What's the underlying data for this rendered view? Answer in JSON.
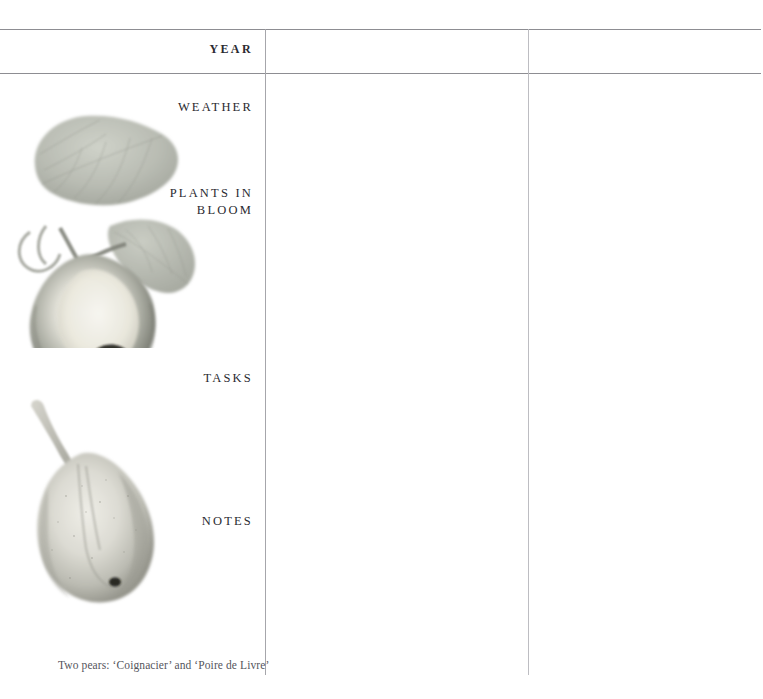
{
  "page": {
    "background_color": "#ffffff",
    "rule_color": "#8d8d92",
    "vertical_rule_color": "#a6a6ab",
    "text_color": "#2a2a30"
  },
  "columns": {
    "label_column_right_edge": 253,
    "divider_1_x": 265,
    "divider_2_x": 528
  },
  "header": {
    "year_label": "YEAR"
  },
  "sections": [
    {
      "label": "WEATHER"
    },
    {
      "label": "PLANTS IN\nBLOOM"
    },
    {
      "label": "TASKS"
    },
    {
      "label": "NOTES"
    }
  ],
  "caption": {
    "text": "Two pears: ‘Coignacier’ and ‘Poire de Livre’"
  },
  "illustrations": [
    {
      "name": "pear-with-leaves-watercolor",
      "description": "Pale grey-green watercolour of a squat pear with two large leaves",
      "body_color": "#b9bcb2",
      "leaf_color": "#b5b8ae",
      "shadow_color": "#7d8078"
    },
    {
      "name": "pear-long-stem-watercolor",
      "description": "Pale grey watercolour of an elongated pear with a long stem",
      "body_color": "#c3c4bc",
      "stem_color": "#b6b7ae",
      "shadow_color": "#8e8f87"
    }
  ]
}
